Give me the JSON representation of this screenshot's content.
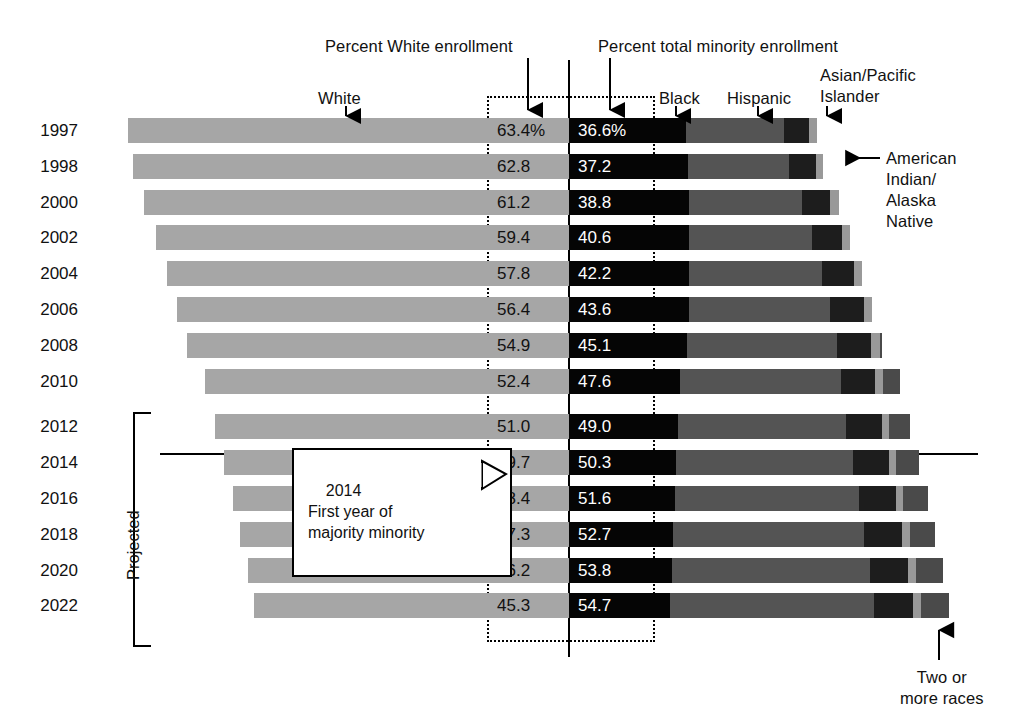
{
  "chart_data": {
    "type": "bar",
    "title": "",
    "subtitle": "",
    "xlabel": "",
    "ylabel": "",
    "grid": false,
    "legend_position": "annotations",
    "orientation": "horizontal-stacked-diverging",
    "annotations": {
      "percent_white_enrollment": "Percent White enrollment",
      "percent_total_minority_enrollment": "Percent total minority enrollment",
      "white": "White",
      "black": "Black",
      "hispanic": "Hispanic",
      "asian_pacific_islander": "Asian/Pacific\nIslander",
      "american_indian_alaska_native": "American\nIndian/\nAlaska\nNative",
      "two_or_more_races": "Two or\nmore races",
      "projected": "Projected",
      "callout": "2014\nFirst year of\nmajority minority"
    },
    "series_names": [
      "White",
      "Black",
      "Hispanic",
      "Asian/Pacific Islander",
      "American Indian/Alaska Native",
      "Two or more races"
    ],
    "colors": {
      "white": "#a6a6a6",
      "black": "#050505",
      "hispanic": "#545454",
      "asian_pacific_islander": "#1d1d1d",
      "american_indian_alaska_native": "#999999",
      "two_or_more_races": "#4a4a4a"
    },
    "categories": [
      "1997",
      "1998",
      "2000",
      "2002",
      "2004",
      "2006",
      "2008",
      "2010",
      "2012",
      "2014",
      "2016",
      "2018",
      "2020",
      "2022"
    ],
    "projected_from": "2012",
    "rows": [
      {
        "year": "1997",
        "white": "63.4%",
        "minority": "36.6%",
        "white_val": 63.4,
        "minority_val": 36.6,
        "black": 16.9,
        "hispanic": 14.0,
        "asian": 3.7,
        "amind": 1.1,
        "two": 0.0,
        "projected": false
      },
      {
        "year": "1998",
        "white": "62.8",
        "minority": "37.2",
        "white_val": 62.8,
        "minority_val": 37.2,
        "black": 17.1,
        "hispanic": 14.5,
        "asian": 3.9,
        "amind": 1.1,
        "two": 0.0,
        "projected": false
      },
      {
        "year": "2000",
        "white": "61.2",
        "minority": "38.8",
        "white_val": 61.2,
        "minority_val": 38.8,
        "black": 17.2,
        "hispanic": 16.3,
        "asian": 4.1,
        "amind": 1.2,
        "two": 0.0,
        "projected": false
      },
      {
        "year": "2002",
        "white": "59.4",
        "minority": "40.6",
        "white_val": 59.4,
        "minority_val": 40.6,
        "black": 17.2,
        "hispanic": 17.7,
        "asian": 4.4,
        "amind": 1.2,
        "two": 0.0,
        "projected": false
      },
      {
        "year": "2004",
        "white": "57.8",
        "minority": "42.2",
        "white_val": 57.8,
        "minority_val": 42.2,
        "black": 17.3,
        "hispanic": 19.1,
        "asian": 4.6,
        "amind": 1.2,
        "two": 0.0,
        "projected": false
      },
      {
        "year": "2006",
        "white": "56.4",
        "minority": "43.6",
        "white_val": 56.4,
        "minority_val": 43.6,
        "black": 17.2,
        "hispanic": 20.4,
        "asian": 4.8,
        "amind": 1.2,
        "two": 0.0,
        "projected": false
      },
      {
        "year": "2008",
        "white": "54.9",
        "minority": "45.1",
        "white_val": 54.9,
        "minority_val": 45.1,
        "black": 17.0,
        "hispanic": 21.5,
        "asian": 5.0,
        "amind": 1.2,
        "two": 0.4,
        "projected": false
      },
      {
        "year": "2010",
        "white": "52.4",
        "minority": "47.6",
        "white_val": 52.4,
        "minority_val": 47.6,
        "black": 16.0,
        "hispanic": 23.1,
        "asian": 5.0,
        "amind": 1.1,
        "two": 2.4,
        "projected": false
      },
      {
        "year": "2012",
        "white": "51.0",
        "minority": "49.0",
        "white_val": 51.0,
        "minority_val": 49.0,
        "black": 15.7,
        "hispanic": 24.2,
        "asian": 5.1,
        "amind": 1.1,
        "two": 2.9,
        "projected": true
      },
      {
        "year": "2014",
        "white": "49.7",
        "minority": "50.3",
        "white_val": 49.7,
        "minority_val": 50.3,
        "black": 15.4,
        "hispanic": 25.4,
        "asian": 5.2,
        "amind": 1.1,
        "two": 3.2,
        "projected": true
      },
      {
        "year": "2016",
        "white": "48.4",
        "minority": "51.6",
        "white_val": 48.4,
        "minority_val": 51.6,
        "black": 15.2,
        "hispanic": 26.5,
        "asian": 5.3,
        "amind": 1.1,
        "two": 3.5,
        "projected": true
      },
      {
        "year": "2018",
        "white": "47.3",
        "minority": "52.7",
        "white_val": 47.3,
        "minority_val": 52.7,
        "black": 15.0,
        "hispanic": 27.5,
        "asian": 5.4,
        "amind": 1.1,
        "two": 3.7,
        "projected": true
      },
      {
        "year": "2020",
        "white": "46.2",
        "minority": "53.8",
        "white_val": 46.2,
        "minority_val": 53.8,
        "black": 14.8,
        "hispanic": 28.5,
        "asian": 5.5,
        "amind": 1.1,
        "two": 3.9,
        "projected": true
      },
      {
        "year": "2022",
        "white": "45.3",
        "minority": "54.7",
        "white_val": 45.3,
        "minority_val": 54.7,
        "black": 14.6,
        "hispanic": 29.3,
        "asian": 5.6,
        "amind": 1.1,
        "two": 4.1,
        "projected": true
      }
    ]
  }
}
